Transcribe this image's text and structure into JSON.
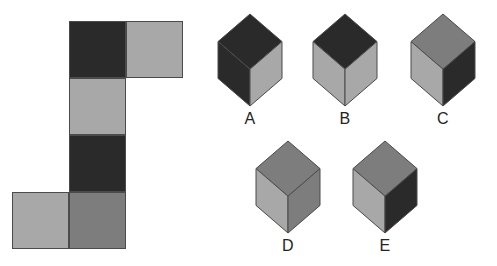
{
  "puzzle": {
    "title": "Cube net and candidate cubes",
    "colors": {
      "dark": "#2a2a2a",
      "medium": "#7d7d7d",
      "light": "#a8a8a8",
      "outline": "#4b4b4b",
      "background": "#ffffff",
      "label_text": "#232323"
    },
    "net": {
      "name": "cube-net",
      "cell_size": 57,
      "origin": {
        "x": 12,
        "y": 21
      },
      "cells": [
        {
          "id": "net-cell-1",
          "col": 1,
          "row": 0,
          "shade": "dark",
          "color": "#2a2a2a"
        },
        {
          "id": "net-cell-2",
          "col": 2,
          "row": 0,
          "shade": "light",
          "color": "#a8a8a8"
        },
        {
          "id": "net-cell-3",
          "col": 1,
          "row": 1,
          "shade": "light",
          "color": "#a8a8a8"
        },
        {
          "id": "net-cell-4",
          "col": 1,
          "row": 2,
          "shade": "dark",
          "color": "#2a2a2a"
        },
        {
          "id": "net-cell-5",
          "col": 0,
          "row": 3,
          "shade": "light",
          "color": "#a8a8a8"
        },
        {
          "id": "net-cell-6",
          "col": 1,
          "row": 3,
          "shade": "medium",
          "color": "#7d7d7d"
        }
      ]
    },
    "cubes": [
      {
        "id": "cube-a",
        "label": "A",
        "x": 218,
        "y": 14,
        "width": 64,
        "height": 92,
        "faces": {
          "top": "#2a2a2a",
          "left": "#2a2a2a",
          "right": "#a8a8a8"
        },
        "face_shades": {
          "top": "dark",
          "left": "dark",
          "right": "light"
        },
        "label_x": 218,
        "label_y": 111
      },
      {
        "id": "cube-b",
        "label": "B",
        "x": 313,
        "y": 14,
        "width": 64,
        "height": 92,
        "faces": {
          "top": "#2a2a2a",
          "left": "#a8a8a8",
          "right": "#a8a8a8"
        },
        "face_shades": {
          "top": "dark",
          "left": "light",
          "right": "light"
        },
        "label_x": 313,
        "label_y": 111
      },
      {
        "id": "cube-c",
        "label": "C",
        "x": 411,
        "y": 14,
        "width": 64,
        "height": 92,
        "faces": {
          "top": "#7d7d7d",
          "left": "#a8a8a8",
          "right": "#2a2a2a"
        },
        "face_shades": {
          "top": "medium",
          "left": "light",
          "right": "dark"
        },
        "label_x": 411,
        "label_y": 111
      },
      {
        "id": "cube-d",
        "label": "D",
        "x": 256,
        "y": 141,
        "width": 64,
        "height": 92,
        "faces": {
          "top": "#7d7d7d",
          "left": "#a8a8a8",
          "right": "#7d7d7d"
        },
        "face_shades": {
          "top": "medium",
          "left": "light",
          "right": "medium"
        },
        "label_x": 256,
        "label_y": 238
      },
      {
        "id": "cube-e",
        "label": "E",
        "x": 353,
        "y": 141,
        "width": 64,
        "height": 92,
        "faces": {
          "top": "#7d7d7d",
          "left": "#a8a8a8",
          "right": "#2a2a2a"
        },
        "face_shades": {
          "top": "medium",
          "left": "light",
          "right": "dark"
        },
        "label_x": 353,
        "label_y": 238
      }
    ]
  }
}
